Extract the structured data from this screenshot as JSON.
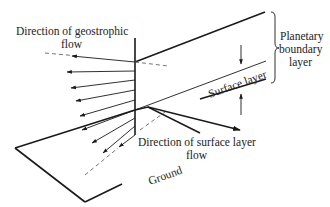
{
  "labels": {
    "geostrophic_line1": "Direction of geostrophic",
    "geostrophic_line2": "flow",
    "pbl_line1": "Planetary",
    "pbl_line2": "boundary",
    "pbl_line3": "layer",
    "surface_layer": "Surface layer",
    "surface_flow_line1": "Direction of surface layer",
    "surface_flow_line2": "flow",
    "ground": "Ground"
  },
  "colors": {
    "line": "#1a1a1a",
    "dashed": "#666666",
    "text": "#222222",
    "background": "#ffffff"
  }
}
